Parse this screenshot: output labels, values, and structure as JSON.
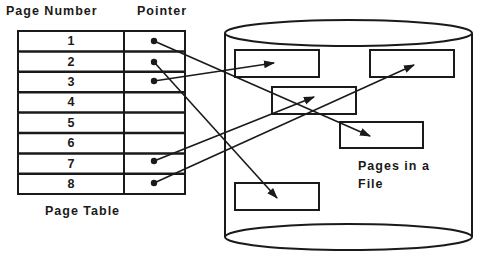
{
  "table": {
    "header_page_number": "Page Number",
    "header_pointer": "Pointer",
    "caption": "Page Table",
    "rows": [
      {
        "page": "1",
        "has_pointer": true
      },
      {
        "page": "2",
        "has_pointer": true
      },
      {
        "page": "3",
        "has_pointer": true
      },
      {
        "page": "4",
        "has_pointer": false
      },
      {
        "page": "5",
        "has_pointer": false
      },
      {
        "page": "6",
        "has_pointer": false
      },
      {
        "page": "7",
        "has_pointer": true
      },
      {
        "page": "8",
        "has_pointer": true
      }
    ]
  },
  "file": {
    "caption_line1": "Pages in a",
    "caption_line2": "File",
    "caption": "Pages in a\nFile"
  },
  "colors": {
    "stroke": "#1a1a1a",
    "background": "#ffffff"
  }
}
